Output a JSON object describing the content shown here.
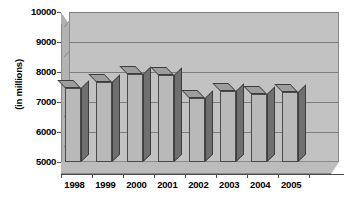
{
  "chart_data": {
    "type": "bar",
    "title": "",
    "subtitle": "",
    "xlabel": "",
    "ylabel": "(in millions)",
    "categories": [
      "1998",
      "1999",
      "2000",
      "2001",
      "2002",
      "2003",
      "2004",
      "2005"
    ],
    "values": [
      7470,
      7670,
      7930,
      7900,
      7130,
      7370,
      7260,
      7330
    ],
    "series": [
      {
        "name": "",
        "values": [
          7470,
          7670,
          7930,
          7900,
          7130,
          7370,
          7260,
          7330
        ]
      }
    ],
    "ylim": [
      5000,
      10000
    ],
    "yticks": [
      5000,
      6000,
      7000,
      8000,
      9000,
      10000
    ],
    "ytick_labels": [
      "5000",
      "6000",
      "7000",
      "8000",
      "9000",
      "10000"
    ],
    "grid": true,
    "grid_axis": "y",
    "legend": false,
    "legend_position": "none",
    "style": "3d-column",
    "colors": {
      "bar_front": "#b9b9b9",
      "bar_side": "#6f6f6f",
      "bar_top": "#9d9d9d",
      "bar_outline": "#4a4a4a",
      "plot_background": "#c2c2c2",
      "floor": "#bcbcbc",
      "wall": "#b3b3b3",
      "gridline": "#7d7d7d",
      "axis": "#4a4a4a",
      "text": "#000000",
      "page_background": "#ffffff"
    }
  }
}
